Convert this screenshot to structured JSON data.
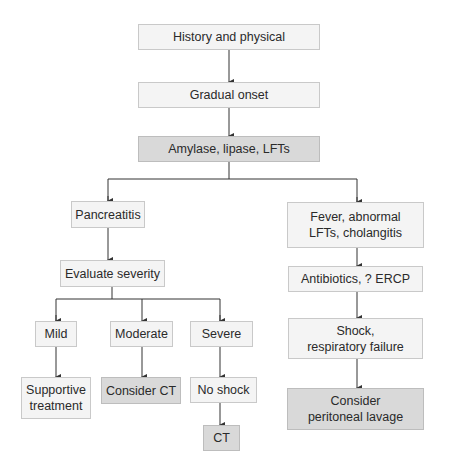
{
  "diagram": {
    "type": "flowchart",
    "nodes": {
      "history": {
        "label": "History and physical",
        "shade": "light"
      },
      "gradual": {
        "label": "Gradual onset",
        "shade": "light"
      },
      "labs": {
        "label": "Amylase, lipase, LFTs",
        "shade": "dark"
      },
      "pancreatitis": {
        "label": "Pancreatitis",
        "shade": "light"
      },
      "evaluate": {
        "label": "Evaluate severity",
        "shade": "light"
      },
      "mild": {
        "label": "Mild",
        "shade": "light"
      },
      "moderate": {
        "label": "Moderate",
        "shade": "light"
      },
      "severe": {
        "label": "Severe",
        "shade": "light"
      },
      "supportive": {
        "label": "Supportive\ntreatment",
        "shade": "light"
      },
      "consider_ct": {
        "label": "Consider CT",
        "shade": "dark"
      },
      "no_shock": {
        "label": "No shock",
        "shade": "light"
      },
      "ct": {
        "label": "CT",
        "shade": "dark"
      },
      "fever": {
        "label": "Fever, abnormal\nLFTs, cholangitis",
        "shade": "light"
      },
      "antibiotics": {
        "label": "Antibiotics, ? ERCP",
        "shade": "light"
      },
      "shock": {
        "label": "Shock,\nrespiratory failure",
        "shade": "light"
      },
      "lavage": {
        "label": "Consider\nperitoneal lavage",
        "shade": "dark"
      }
    },
    "edges": [
      [
        "history",
        "gradual"
      ],
      [
        "gradual",
        "labs"
      ],
      [
        "labs",
        "pancreatitis"
      ],
      [
        "labs",
        "fever"
      ],
      [
        "pancreatitis",
        "evaluate"
      ],
      [
        "evaluate",
        "mild"
      ],
      [
        "evaluate",
        "moderate"
      ],
      [
        "evaluate",
        "severe"
      ],
      [
        "mild",
        "supportive"
      ],
      [
        "moderate",
        "consider_ct"
      ],
      [
        "severe",
        "no_shock"
      ],
      [
        "no_shock",
        "ct"
      ],
      [
        "fever",
        "antibiotics"
      ],
      [
        "antibiotics",
        "shock"
      ],
      [
        "shock",
        "lavage"
      ]
    ],
    "colors": {
      "light_fill": "#f4f4f4",
      "dark_fill": "#d9d9d9",
      "border": "#c9c9c9",
      "line": "#333333"
    }
  }
}
